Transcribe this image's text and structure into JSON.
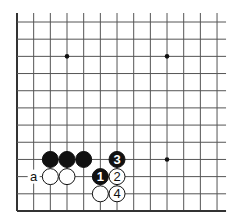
{
  "board": {
    "cols": 13,
    "rows": 12,
    "origin_x": 17,
    "origin_y": 22,
    "spacing_x": 16.67,
    "spacing_y": 17.18,
    "top_extension": 9,
    "right_extension": 9,
    "line_color": "#555555",
    "edge_color": "#333333",
    "star_points": [
      [
        3,
        2
      ],
      [
        9,
        2
      ],
      [
        9,
        8
      ]
    ],
    "stones": [
      {
        "col": 2,
        "row": 8,
        "color": "black",
        "label": ""
      },
      {
        "col": 3,
        "row": 8,
        "color": "black",
        "label": ""
      },
      {
        "col": 4,
        "row": 8,
        "color": "black",
        "label": ""
      },
      {
        "col": 6,
        "row": 8,
        "color": "black",
        "label": "3"
      },
      {
        "col": 2,
        "row": 9,
        "color": "white",
        "label": ""
      },
      {
        "col": 3,
        "row": 9,
        "color": "white",
        "label": ""
      },
      {
        "col": 5,
        "row": 9,
        "color": "black",
        "label": "1"
      },
      {
        "col": 6,
        "row": 9,
        "color": "white",
        "label": "2"
      },
      {
        "col": 5,
        "row": 10,
        "color": "white",
        "label": ""
      },
      {
        "col": 6,
        "row": 10,
        "color": "white",
        "label": "4"
      }
    ],
    "marks": [
      {
        "col": 1,
        "row": 9,
        "text": "a"
      }
    ]
  }
}
